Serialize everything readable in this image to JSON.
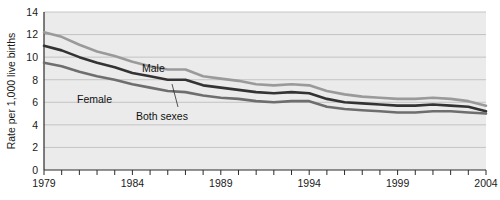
{
  "figure": {
    "ylabel": "Rate per 1,000 live births",
    "xlabel": ""
  },
  "annotations": {
    "male": "Male",
    "female": "Female",
    "both_sexes": "Both sexes"
  },
  "colors": {
    "male": "#9a9a9a",
    "female": "#6e6e6e",
    "both_sexes": "#333333",
    "plot_background": "#ebebeb",
    "gridline": "#b9b9b9",
    "axis": "#2b2b2b",
    "text": "#1a1a1a"
  },
  "chart_data": {
    "type": "line",
    "title": "",
    "subtitle": "",
    "xlabel": "",
    "ylabel": "Rate per 1,000 live births",
    "xlim": [
      1979,
      2004
    ],
    "ylim": [
      0,
      14
    ],
    "grid": true,
    "legend_position": "inline-annotations",
    "y_ticks": [
      0,
      2,
      4,
      6,
      8,
      10,
      12,
      14
    ],
    "y_tick_labels": [
      "0",
      "2",
      "4",
      "6",
      "8",
      "10",
      "12",
      "14"
    ],
    "x_ticks": [
      1979,
      1980,
      1981,
      1982,
      1983,
      1984,
      1985,
      1986,
      1987,
      1988,
      1989,
      1990,
      1991,
      1992,
      1993,
      1994,
      1995,
      1996,
      1997,
      1998,
      1999,
      2000,
      2001,
      2002,
      2003,
      2004
    ],
    "x_tick_labels_shown": [
      "1979",
      "1984",
      "1989",
      "1994",
      "1999",
      "2004"
    ],
    "x": [
      1979,
      1980,
      1981,
      1982,
      1983,
      1984,
      1985,
      1986,
      1987,
      1988,
      1989,
      1990,
      1991,
      1992,
      1993,
      1994,
      1995,
      1996,
      1997,
      1998,
      1999,
      2000,
      2001,
      2002,
      2003,
      2004
    ],
    "series": [
      {
        "name": "Male",
        "color": "#9a9a9a",
        "values": [
          12.2,
          11.8,
          11.1,
          10.5,
          10.1,
          9.6,
          9.2,
          8.9,
          8.9,
          8.3,
          8.1,
          7.9,
          7.6,
          7.5,
          7.6,
          7.5,
          7.0,
          6.7,
          6.5,
          6.4,
          6.3,
          6.3,
          6.4,
          6.3,
          6.1,
          5.7
        ]
      },
      {
        "name": "Both sexes",
        "color": "#333333",
        "values": [
          11.0,
          10.6,
          10.0,
          9.5,
          9.1,
          8.6,
          8.3,
          8.0,
          8.0,
          7.5,
          7.3,
          7.1,
          6.9,
          6.8,
          6.9,
          6.8,
          6.3,
          6.0,
          5.9,
          5.8,
          5.7,
          5.7,
          5.8,
          5.7,
          5.6,
          5.2
        ]
      },
      {
        "name": "Female",
        "color": "#6e6e6e",
        "values": [
          9.5,
          9.2,
          8.7,
          8.3,
          8.0,
          7.6,
          7.3,
          7.0,
          6.9,
          6.6,
          6.4,
          6.3,
          6.1,
          6.0,
          6.1,
          6.1,
          5.6,
          5.4,
          5.3,
          5.2,
          5.1,
          5.1,
          5.2,
          5.2,
          5.1,
          5.0
        ]
      }
    ]
  }
}
